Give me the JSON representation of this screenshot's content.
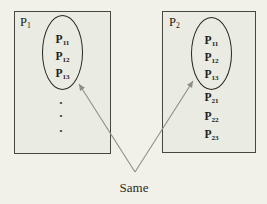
{
  "colors": {
    "background": "#f1f1e9",
    "box_fill": "#eaebe2",
    "box_border": "#47473f",
    "ellipse_border": "#26261f",
    "text": "#21211b",
    "arrow": "#8f8f85"
  },
  "left_box": {
    "label": {
      "base": "P",
      "sub": "1"
    },
    "ellipse_items": [
      {
        "base": "P",
        "sub": "11"
      },
      {
        "base": "P",
        "sub": "12"
      },
      {
        "base": "P",
        "sub": "13"
      }
    ],
    "dots": [
      "·",
      "·",
      "·"
    ]
  },
  "right_box": {
    "label": {
      "base": "P",
      "sub": "2"
    },
    "ellipse_items": [
      {
        "base": "P",
        "sub": "11"
      },
      {
        "base": "P",
        "sub": "12"
      },
      {
        "base": "P",
        "sub": "13"
      }
    ],
    "below_items": [
      {
        "base": "P",
        "sub": "21"
      },
      {
        "base": "P",
        "sub": "22"
      },
      {
        "base": "P",
        "sub": "23"
      }
    ]
  },
  "annotation": {
    "label": "Same"
  }
}
